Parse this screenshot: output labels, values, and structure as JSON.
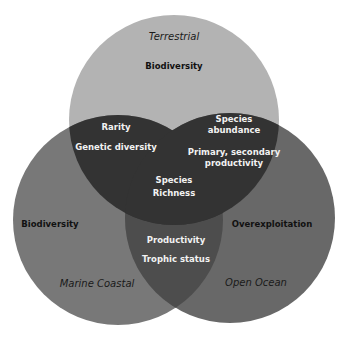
{
  "colors": {
    "terrestrial": "#b3b3b3",
    "marine_coastal": "#787878",
    "open_ocean": "#686868",
    "overlap_top": "#333333",
    "overlap_bottom": "#4d4d4d"
  },
  "sets": {
    "terrestrial": {
      "name": "Terrestrial",
      "label": "Biodiversity"
    },
    "marine_coastal": {
      "name": "Marine Coastal",
      "label": "Biodiversity"
    },
    "open_ocean": {
      "name": "Open Ocean",
      "label": "Overexploitation"
    }
  },
  "overlaps": {
    "terrestrial_marine": [
      "Rarity",
      "Genetic diversity"
    ],
    "terrestrial_ocean": [
      "Species abundance",
      "Primary, secondary productivity"
    ],
    "all_three": [
      "Species",
      "Richness"
    ],
    "marine_ocean": [
      "Productivity",
      "Trophic status"
    ]
  },
  "text": {
    "ta_1": "Rarity",
    "ta_2": "Genetic diversity",
    "to_1a": "Species",
    "to_1b": "abundance",
    "to_2a": "Primary, secondary",
    "to_2b": "productivity",
    "all_a": "Species",
    "all_b": "Richness",
    "mo_1": "Productivity",
    "mo_2": "Trophic status"
  }
}
